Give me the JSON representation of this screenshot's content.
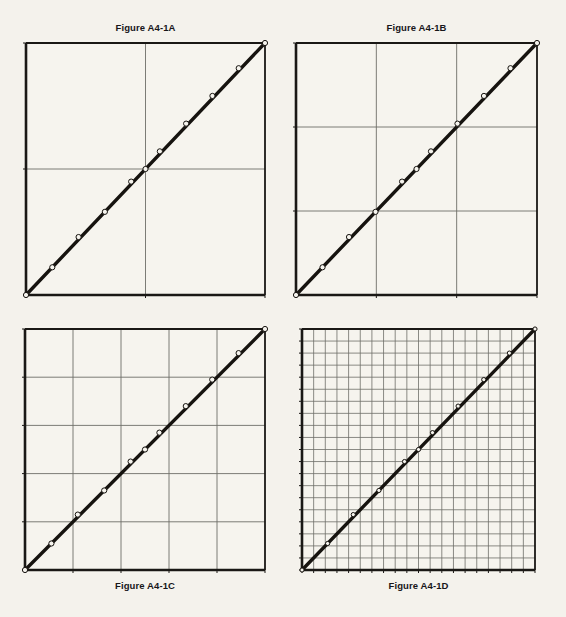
{
  "page": {
    "background_color": "#f4f2ec",
    "ink_color": "#1a1815",
    "grid_color": "#6e6e68",
    "line_color": "#16130f",
    "marker_fill": "#f6f4ee"
  },
  "figures": [
    {
      "id": "a",
      "title": "Figure A4-1A",
      "title_position": "top",
      "grid_divisions_x": 2,
      "grid_divisions_y": 2,
      "box": {
        "x": 23,
        "y": 40,
        "w": 245,
        "h": 258
      }
    },
    {
      "id": "b",
      "title": "Figure A4-1B",
      "title_position": "top",
      "grid_divisions_x": 3,
      "grid_divisions_y": 3,
      "box": {
        "x": 293,
        "y": 40,
        "w": 247,
        "h": 258
      }
    },
    {
      "id": "c",
      "title": "Figure A4-1C",
      "title_position": "bottom",
      "grid_divisions_x": 5,
      "grid_divisions_y": 5,
      "box": {
        "x": 22,
        "y": 326,
        "w": 246,
        "h": 247
      }
    },
    {
      "id": "d",
      "title": "Figure A4-1D",
      "title_position": "bottom",
      "grid_divisions_x": 20,
      "grid_divisions_y": 20,
      "box": {
        "x": 299,
        "y": 326,
        "w": 239,
        "h": 247
      }
    }
  ],
  "chart_data": {
    "type": "line",
    "xlabel": "",
    "ylabel": "",
    "xlim": [
      0,
      1
    ],
    "ylim": [
      0,
      1
    ],
    "grid": true,
    "legend": "none",
    "reference_line": {
      "name": "45-degree identity line",
      "from": [
        0,
        0
      ],
      "to": [
        1,
        1
      ],
      "style": "thick solid black"
    },
    "series": [
      {
        "name": "Observed vs. theoretical quantiles",
        "marker": "open-circle",
        "x": [
          0.0,
          0.11,
          0.22,
          0.33,
          0.44,
          0.5,
          0.56,
          0.67,
          0.78,
          0.89,
          1.0
        ],
        "y": [
          0.0,
          0.11,
          0.23,
          0.33,
          0.45,
          0.5,
          0.57,
          0.68,
          0.79,
          0.9,
          1.0
        ]
      }
    ],
    "panels": [
      {
        "label": "Figure A4-1A",
        "grid_divisions_x": 2,
        "grid_divisions_y": 2,
        "xticks": [
          0,
          0.5,
          1
        ],
        "yticks": [
          0,
          0.5,
          1
        ]
      },
      {
        "label": "Figure A4-1B",
        "grid_divisions_x": 3,
        "grid_divisions_y": 3,
        "xticks": [
          0,
          0.333,
          0.667,
          1
        ],
        "yticks": [
          0,
          0.333,
          0.667,
          1
        ]
      },
      {
        "label": "Figure A4-1C",
        "grid_divisions_x": 5,
        "grid_divisions_y": 5,
        "xticks": [
          0,
          0.2,
          0.4,
          0.6,
          0.8,
          1
        ],
        "yticks": [
          0,
          0.2,
          0.4,
          0.6,
          0.8,
          1
        ]
      },
      {
        "label": "Figure A4-1D",
        "grid_divisions_x": 20,
        "grid_divisions_y": 20,
        "xticks": [
          0,
          0.05,
          0.1,
          0.15,
          0.2,
          0.25,
          0.3,
          0.35,
          0.4,
          0.45,
          0.5,
          0.55,
          0.6,
          0.65,
          0.7,
          0.75,
          0.8,
          0.85,
          0.9,
          0.95,
          1
        ],
        "yticks": [
          0,
          0.05,
          0.1,
          0.15,
          0.2,
          0.25,
          0.3,
          0.35,
          0.4,
          0.45,
          0.5,
          0.55,
          0.6,
          0.65,
          0.7,
          0.75,
          0.8,
          0.85,
          0.9,
          0.95,
          1
        ]
      }
    ]
  }
}
